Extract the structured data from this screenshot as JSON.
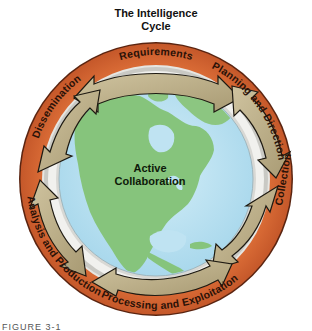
{
  "title": {
    "line1": "The Intelligence",
    "line2": "Cycle"
  },
  "center": {
    "line1": "Active",
    "line2": "Collaboration"
  },
  "stages": [
    {
      "label": "Requirements",
      "position": "top"
    },
    {
      "label": "Planning and Direction",
      "position": "upper-right"
    },
    {
      "label": "Collection",
      "position": "right"
    },
    {
      "label": "Processing and Exploitation",
      "position": "bottom"
    },
    {
      "label": "Analysis and Production",
      "position": "lower-left"
    },
    {
      "label": "Dissemination",
      "position": "upper-left"
    }
  ],
  "caption": "FIGURE 3-1",
  "colors": {
    "ring": "#d2632f",
    "ring_edge": "#5a2410",
    "arrow": "#b9ab86",
    "arrow_edge": "#1e1a12",
    "ocean": "#bfe3f2",
    "land": "#86c47c",
    "silver_band": "#e4e4e0"
  }
}
